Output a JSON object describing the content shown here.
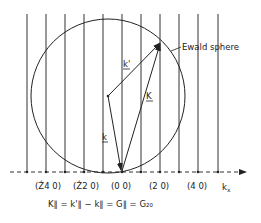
{
  "diagram": {
    "ewald_label": "Ewald sphere",
    "axis_label": "k",
    "axis_subscript": "x",
    "vectors": {
      "k_prime": "k'",
      "K": "K",
      "k": "k"
    },
    "rod_labels": [
      {
        "text": "(Ź4 0)",
        "x": 45
      },
      {
        "text": "(Ź2 0)",
        "x": 83
      },
      {
        "text": "(0 0)",
        "x": 121
      },
      {
        "text": "(2 0)",
        "x": 159
      },
      {
        "text": "(4 0)",
        "x": 197
      }
    ],
    "equation": "K∥ = k'∥ − k∥ = G∥ = G₂₀",
    "colors": {
      "line": "#222222",
      "background": "#ffffff"
    }
  }
}
